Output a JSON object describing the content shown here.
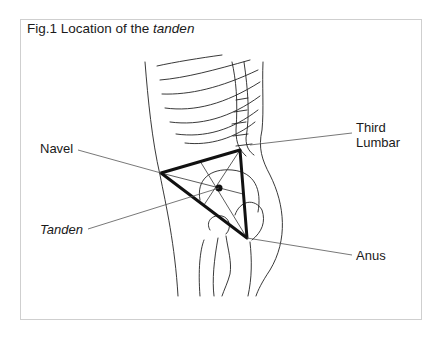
{
  "figure": {
    "title_prefix": "Fig.1 Location of the ",
    "title_emphasis": "tanden"
  },
  "labels": {
    "navel": "Navel",
    "tanden": "Tanden",
    "third_lumbar_line1": "Third",
    "third_lumbar_line2": "Lumbar",
    "anus": "Anus"
  },
  "colors": {
    "line": "#1a1a1a",
    "frame": "#cfcfcf",
    "leader": "#555555"
  }
}
